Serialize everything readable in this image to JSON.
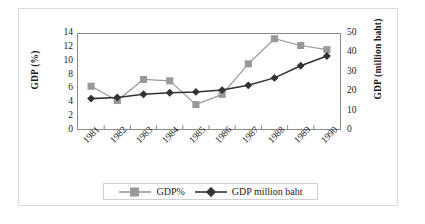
{
  "chart_data": {
    "type": "line",
    "title": "",
    "xlabel": "",
    "categories": [
      "1981",
      "1982",
      "1983",
      "1984",
      "1985",
      "1986",
      "1987",
      "1988",
      "1989",
      "1990"
    ],
    "series": [
      {
        "name": "GDP%",
        "axis": "left",
        "color": "#999999",
        "marker": "square",
        "values": [
          6.3,
          4.2,
          7.3,
          7.1,
          3.6,
          5.1,
          9.6,
          13.3,
          12.3,
          11.7
        ]
      },
      {
        "name": "GDP million baht",
        "axis": "right",
        "color": "#333333",
        "marker": "diamond",
        "values": [
          16.0,
          16.6,
          18.3,
          19.1,
          19.5,
          20.5,
          23.0,
          26.9,
          33.3,
          38.4
        ]
      }
    ],
    "left_axis": {
      "label": "GDP (%)",
      "ticks": [
        0,
        2,
        4,
        6,
        8,
        10,
        12,
        14
      ],
      "ylim": [
        0,
        14
      ]
    },
    "right_axis": {
      "label": "GDP (million baht)",
      "ticks": [
        0,
        10,
        20,
        30,
        40,
        50
      ],
      "ylim": [
        0,
        50
      ]
    },
    "legend": {
      "position": "bottom",
      "entries": [
        "GDP%",
        "GDP million baht"
      ]
    },
    "grid": false
  },
  "colors": {
    "series_gdp_percent": "#999999",
    "series_gdp_baht": "#333333",
    "plot_border": "#8a8a8a",
    "figure_border": "#d8d8d8"
  }
}
